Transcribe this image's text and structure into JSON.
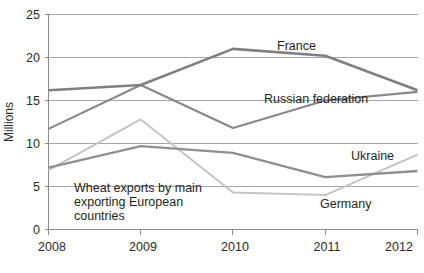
{
  "chart_data": {
    "type": "line",
    "title": "",
    "annotation": "Wheat exports by main exporting European countries",
    "annotation_lines": [
      "Wheat exports by main",
      "exporting European",
      "countries"
    ],
    "xlabel": "",
    "ylabel": "Millions",
    "categories": [
      "2008",
      "2009",
      "2010",
      "2011",
      "2012"
    ],
    "x": [
      2008,
      2009,
      2010,
      2011,
      2012
    ],
    "ylim": [
      0,
      25
    ],
    "yticks": [
      0,
      5,
      10,
      15,
      20,
      25
    ],
    "ytick_labels": [
      "0",
      "5",
      "10",
      "15",
      "20",
      "25"
    ],
    "grid": "horizontal",
    "legend": "inline-labels",
    "series": [
      {
        "name": "France",
        "label": "France",
        "color": "#808080",
        "width": 2.6,
        "values": [
          16.2,
          16.8,
          21.0,
          20.2,
          16.2
        ]
      },
      {
        "name": "Russian federation",
        "label": "Russian federation",
        "color": "#888888",
        "width": 2.1,
        "values": [
          11.7,
          16.8,
          11.8,
          15.0,
          16.0
        ]
      },
      {
        "name": "Ukraine",
        "label": "Ukraine",
        "color": "#8f8f8f",
        "width": 2.3,
        "values": [
          7.2,
          9.7,
          8.9,
          6.1,
          6.8
        ]
      },
      {
        "name": "Germany",
        "label": "Germany",
        "color": "#c4c4c4",
        "width": 2.0,
        "values": [
          6.9,
          12.8,
          4.3,
          4.0,
          8.7
        ]
      }
    ]
  },
  "labels": {
    "france": "France",
    "russian_federation": "Russian federation",
    "ukraine": "Ukraine",
    "germany": "Germany",
    "y_axis_title": "Millions",
    "annotation_line_1": "Wheat exports by main",
    "annotation_line_2": "exporting European",
    "annotation_line_3": "countries",
    "ytick_0": "0",
    "ytick_5": "5",
    "ytick_10": "10",
    "ytick_15": "15",
    "ytick_20": "20",
    "ytick_25": "25",
    "xtick_2008": "2008",
    "xtick_2009": "2009",
    "xtick_2010": "2010",
    "xtick_2011": "2011",
    "xtick_2012": "2012"
  }
}
